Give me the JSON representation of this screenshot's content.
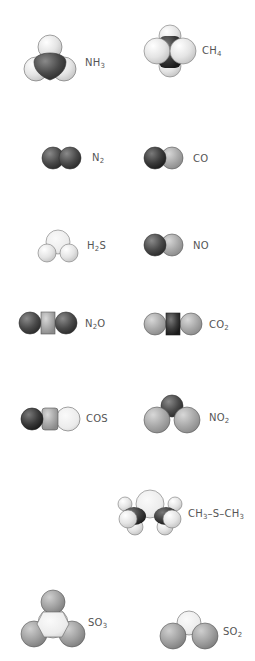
{
  "figure": {
    "title": "",
    "molecules": [
      {
        "id": "nh3",
        "formula": "NH3",
        "label_parts": [
          "NH",
          "3",
          ""
        ]
      },
      {
        "id": "ch4",
        "formula": "CH4",
        "label_parts": [
          "CH",
          "4",
          ""
        ]
      },
      {
        "id": "n2",
        "formula": "N2",
        "label_parts": [
          "N",
          "2",
          ""
        ]
      },
      {
        "id": "co",
        "formula": "CO",
        "label_parts": [
          "CO",
          "",
          ""
        ]
      },
      {
        "id": "h2s",
        "formula": "H2S",
        "label_parts": [
          "H",
          "2",
          "S"
        ]
      },
      {
        "id": "no",
        "formula": "NO",
        "label_parts": [
          "NO",
          "",
          ""
        ]
      },
      {
        "id": "n2o",
        "formula": "N2O",
        "label_parts": [
          "N",
          "2",
          "O"
        ]
      },
      {
        "id": "co2",
        "formula": "CO2",
        "label_parts": [
          "CO",
          "2",
          ""
        ]
      },
      {
        "id": "cos",
        "formula": "COS",
        "label_parts": [
          "COS",
          "",
          ""
        ]
      },
      {
        "id": "no2",
        "formula": "NO2",
        "label_parts": [
          "NO",
          "2",
          ""
        ]
      },
      {
        "id": "dms",
        "formula": "CH3–S–CH3",
        "label_parts": [
          "CH",
          "3",
          "–S–CH",
          "3"
        ]
      },
      {
        "id": "so3",
        "formula": "SO3",
        "label_parts": [
          "SO",
          "3",
          ""
        ]
      },
      {
        "id": "so2",
        "formula": "SO2",
        "label_parts": [
          "SO",
          "2",
          ""
        ]
      }
    ]
  },
  "colors": {
    "nitrogen": "#4a4a4a",
    "carbon": "#3a3a3a",
    "oxygen": "#a8a8a8",
    "hydrogen": "#e6e6e6",
    "sulfur": "#ececec",
    "outline": "#555555",
    "label": "#555555"
  }
}
